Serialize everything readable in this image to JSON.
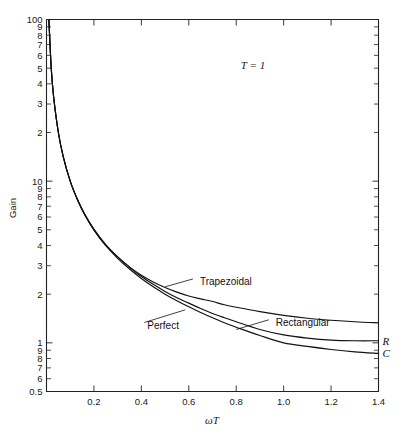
{
  "figure": {
    "background": "#ffffff",
    "ink_color": "#111111",
    "annotation": "T = 1"
  },
  "chart_data": {
    "type": "line",
    "title": "",
    "subtitle": "",
    "annotations": [
      {
        "text": "T = 1",
        "x": 0.78,
        "y": 38,
        "style": "italic-serif"
      }
    ],
    "xlabel": "ωT",
    "ylabel": "Gain",
    "xscale": "linear",
    "yscale": "log",
    "xlim": [
      0.0,
      1.4
    ],
    "ylim": [
      0.5,
      100
    ],
    "grid": false,
    "legend": "inline-labels",
    "x_ticks": [
      0.2,
      0.4,
      0.6,
      0.8,
      1.0,
      1.2,
      1.4
    ],
    "x_ticklabels": [
      "0.2",
      "0.4",
      "0.6",
      "0.8",
      "1.0",
      "1.2",
      "1.4"
    ],
    "y_ticks": [
      100,
      90,
      80,
      70,
      60,
      50,
      40,
      30,
      20,
      10,
      9,
      8,
      7,
      6,
      5,
      4,
      3,
      2,
      1,
      0.9,
      0.8,
      0.7,
      0.6,
      0.5
    ],
    "y_ticklabels": [
      "100",
      "9",
      "8",
      "7",
      "6",
      "5",
      "4",
      "3",
      "2",
      "10",
      "9",
      "8",
      "7",
      "6",
      "5",
      "4",
      "3",
      "2",
      "1",
      "9",
      "8",
      "7",
      "6",
      "0.5"
    ],
    "edge_labels": [
      {
        "text": "R",
        "at_y": 1.03
      },
      {
        "text": "C",
        "at_y": 0.86
      }
    ],
    "series": [
      {
        "name": "Trapezoidal",
        "label_position": {
          "x": 0.63,
          "y": 2.35
        },
        "x": [
          0.01,
          0.02,
          0.03,
          0.05,
          0.07,
          0.1,
          0.13,
          0.16,
          0.2,
          0.25,
          0.3,
          0.35,
          0.4,
          0.45,
          0.5,
          0.55,
          0.6,
          0.65,
          0.7,
          0.75,
          0.8,
          0.9,
          1.0,
          1.1,
          1.2,
          1.3,
          1.4
        ],
        "y": [
          100,
          50,
          33.3,
          20,
          14.3,
          10,
          7.7,
          6.25,
          5.0,
          4.0,
          3.4,
          2.95,
          2.62,
          2.38,
          2.2,
          2.06,
          1.95,
          1.87,
          1.8,
          1.72,
          1.66,
          1.56,
          1.48,
          1.42,
          1.38,
          1.35,
          1.33
        ]
      },
      {
        "name": "Perfect",
        "label_position": {
          "x": 0.52,
          "y": 1.34
        },
        "x": [
          0.01,
          0.02,
          0.03,
          0.05,
          0.07,
          0.1,
          0.13,
          0.16,
          0.2,
          0.25,
          0.3,
          0.35,
          0.4,
          0.45,
          0.5,
          0.55,
          0.6,
          0.65,
          0.7,
          0.75,
          0.8,
          0.9,
          1.0,
          1.1,
          1.2,
          1.3,
          1.4
        ],
        "y": [
          100,
          50,
          33.3,
          20,
          14.3,
          10,
          7.7,
          6.25,
          5.0,
          4.0,
          3.33,
          2.86,
          2.5,
          2.22,
          2.0,
          1.82,
          1.67,
          1.54,
          1.43,
          1.33,
          1.25,
          1.11,
          1.0,
          0.95,
          0.91,
          0.88,
          0.86
        ]
      },
      {
        "name": "Rectangular",
        "label_position": {
          "x": 1.0,
          "y": 1.28
        },
        "x": [
          0.01,
          0.02,
          0.03,
          0.05,
          0.07,
          0.1,
          0.13,
          0.16,
          0.2,
          0.25,
          0.3,
          0.35,
          0.4,
          0.45,
          0.5,
          0.55,
          0.6,
          0.65,
          0.7,
          0.75,
          0.8,
          0.9,
          1.0,
          1.1,
          1.2,
          1.3,
          1.4
        ],
        "y": [
          100,
          50,
          33.3,
          20,
          14.3,
          10,
          7.75,
          6.3,
          5.05,
          4.05,
          3.4,
          2.93,
          2.57,
          2.3,
          2.08,
          1.9,
          1.76,
          1.63,
          1.52,
          1.43,
          1.35,
          1.21,
          1.12,
          1.07,
          1.04,
          1.03,
          1.03
        ]
      }
    ]
  }
}
